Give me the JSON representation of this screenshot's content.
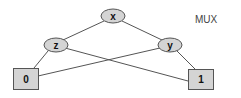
{
  "title": "MUX",
  "colors": {
    "node_fill": "#d4d4d4",
    "node_stroke": "#555555",
    "edge": "#555555"
  },
  "nodes": {
    "x": {
      "label": "x",
      "shape": "ellipse"
    },
    "z": {
      "label": "z",
      "shape": "ellipse"
    },
    "y": {
      "label": "y",
      "shape": "ellipse"
    },
    "t0": {
      "label": "0",
      "shape": "box"
    },
    "t1": {
      "label": "1",
      "shape": "box"
    }
  },
  "edges": [
    {
      "from": "x",
      "to": "z"
    },
    {
      "from": "x",
      "to": "y"
    },
    {
      "from": "z",
      "to": "t0"
    },
    {
      "from": "z",
      "to": "t1"
    },
    {
      "from": "y",
      "to": "t0"
    },
    {
      "from": "y",
      "to": "t1"
    }
  ]
}
